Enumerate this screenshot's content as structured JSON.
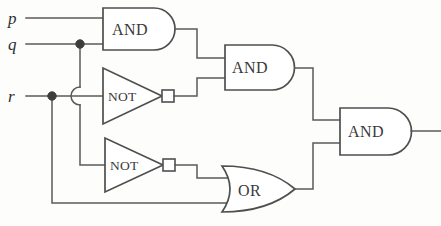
{
  "diagram": {
    "type": "logic-gate-circuit",
    "background_color": "#fdfdfc",
    "wire_color": "#5a5a5a",
    "gate_stroke_color": "#4f4f4f",
    "label_color": "#39393b"
  },
  "inputs": [
    {
      "id": "p",
      "label": "p",
      "y": 18
    },
    {
      "id": "q",
      "label": "q",
      "y": 44
    },
    {
      "id": "r",
      "label": "r",
      "y": 96
    }
  ],
  "gates": [
    {
      "id": "and1",
      "label": "AND",
      "type": "AND",
      "x": 103,
      "y": 8,
      "w": 72,
      "h": 42
    },
    {
      "id": "not1",
      "label": "NOT",
      "type": "NOT",
      "x": 103,
      "y": 68,
      "w": 62,
      "h": 56
    },
    {
      "id": "not2",
      "label": "NOT",
      "type": "NOT",
      "x": 105,
      "y": 138,
      "w": 62,
      "h": 54
    },
    {
      "id": "and2",
      "label": "AND",
      "type": "AND",
      "x": 225,
      "y": 45,
      "w": 70,
      "h": 45
    },
    {
      "id": "or1",
      "label": "OR",
      "type": "OR",
      "x": 222,
      "y": 166,
      "w": 73,
      "h": 46
    },
    {
      "id": "and3",
      "label": "AND",
      "type": "AND",
      "x": 340,
      "y": 108,
      "w": 72,
      "h": 47
    }
  ],
  "junctions": [
    {
      "id": "q-branch",
      "x": 80,
      "y": 44
    },
    {
      "id": "r-branch",
      "x": 52,
      "y": 96
    }
  ],
  "connections": [
    {
      "id": "p-to-and1",
      "from": "p",
      "to": "and1"
    },
    {
      "id": "q-to-and1",
      "from": "q",
      "to": "and1"
    },
    {
      "id": "q-to-not2",
      "from": "q",
      "to": "not2"
    },
    {
      "id": "r-to-not1",
      "from": "r",
      "to": "not1"
    },
    {
      "id": "r-to-or1",
      "from": "r",
      "to": "or1"
    },
    {
      "id": "and1-to-and2",
      "from": "and1",
      "to": "and2"
    },
    {
      "id": "not1-to-and2",
      "from": "not1",
      "to": "and2"
    },
    {
      "id": "not2-to-or1",
      "from": "not2",
      "to": "or1"
    },
    {
      "id": "and2-to-and3",
      "from": "and2",
      "to": "and3"
    },
    {
      "id": "or1-to-and3",
      "from": "or1",
      "to": "and3"
    },
    {
      "id": "and3-to-output",
      "from": "and3",
      "to": "output"
    }
  ],
  "crossings": [
    {
      "id": "q-over-r-hop",
      "x": 80,
      "y": 96
    }
  ]
}
